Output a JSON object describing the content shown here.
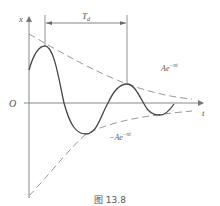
{
  "figure": {
    "caption": "图 13.8",
    "axes": {
      "y_label": "x",
      "x_label": "t",
      "origin_label": "O"
    },
    "dimension": {
      "label_main": "T",
      "label_sub": "d"
    },
    "envelopes": {
      "upper_label_main": "Ae",
      "upper_label_exp": "−nt",
      "lower_label_main": "−Ae",
      "lower_label_exp": "−nt"
    },
    "colors": {
      "curve": "#444444",
      "axis": "#777777",
      "envelope": "#999999"
    }
  }
}
